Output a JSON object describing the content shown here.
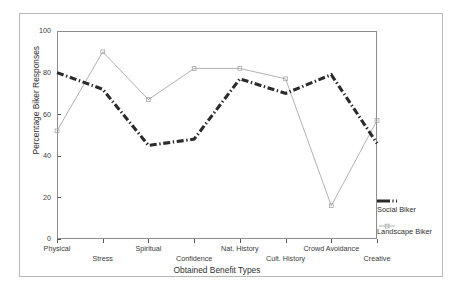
{
  "chart_data": {
    "type": "line",
    "title": "",
    "xlabel": "Obtained Benefit Types",
    "ylabel": "Percentage Biker Responses",
    "categories": [
      "Physical",
      "Stress",
      "Spiritual",
      "Confidence",
      "Nat. History",
      "Cult. History",
      "Crowd Avoidance",
      "Creative"
    ],
    "series": [
      {
        "name": "Social Biker",
        "values": [
          80,
          72,
          45,
          48,
          77,
          70,
          79,
          46
        ],
        "color": "#2b2b2b",
        "style": "thick-dash-dot"
      },
      {
        "name": "Landscape Biker",
        "values": [
          52,
          90,
          67,
          82,
          82,
          77,
          16,
          57
        ],
        "color": "#a8a8a8",
        "style": "thin-line-square-markers"
      }
    ],
    "ylim": [
      0,
      100
    ],
    "yticks": [
      0,
      20,
      40,
      60,
      80,
      100
    ],
    "ytick_labels": [
      "0",
      "20",
      "40",
      "60",
      "80",
      "100"
    ],
    "grid": false,
    "legend_position": "right-bottom"
  },
  "axes": {
    "y_label": "Percentage Biker Responses",
    "x_label": "Obtained Benefit Types",
    "y_ticks": [
      "100",
      "80",
      "60",
      "40",
      "20",
      "0"
    ]
  },
  "legend": {
    "items": [
      {
        "label": "Social Biker"
      },
      {
        "label": "Landscape Biker"
      }
    ]
  }
}
